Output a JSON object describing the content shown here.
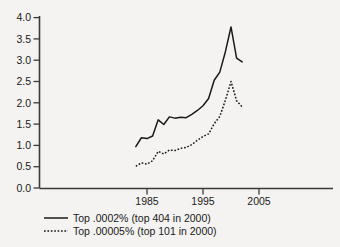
{
  "chart_data": {
    "type": "line",
    "title": "",
    "subtitle": "",
    "xlabel": "",
    "ylabel": "",
    "xlim": [
      1982,
      2006.5
    ],
    "ylim": [
      0.0,
      4.0
    ],
    "grid": false,
    "legend_position": "bottom-left",
    "yticks": [
      "0.0",
      "0.5",
      "1.0",
      "1.5",
      "2.0",
      "2.5",
      "3.0",
      "3.5",
      "4.0"
    ],
    "ytick_values": [
      0.0,
      0.5,
      1.0,
      1.5,
      2.0,
      2.5,
      3.0,
      3.5,
      4.0
    ],
    "xticks": [
      "1985",
      "1995",
      "2005"
    ],
    "xtick_values": [
      1985,
      1995,
      2005
    ],
    "series": [
      {
        "name": "Top .0002% (top 404 in 2000)",
        "style": "solid",
        "x": [
          1983,
          1984,
          1985,
          1986,
          1987,
          1988,
          1989,
          1990,
          1991,
          1992,
          1993,
          1994,
          1995,
          1996,
          1997,
          1998,
          1999,
          2000,
          2001,
          2002
        ],
        "values": [
          0.97,
          1.18,
          1.16,
          1.22,
          1.6,
          1.49,
          1.67,
          1.64,
          1.66,
          1.65,
          1.73,
          1.82,
          1.93,
          2.1,
          2.53,
          2.72,
          3.2,
          3.78,
          3.05,
          2.96
        ]
      },
      {
        "name": "Top .00005% (top 101 in 2000)",
        "style": "dotted",
        "x": [
          1983,
          1984,
          1985,
          1986,
          1987,
          1988,
          1989,
          1990,
          1991,
          1992,
          1993,
          1994,
          1995,
          1996,
          1997,
          1998,
          1999,
          2000,
          2001,
          2002
        ],
        "values": [
          0.51,
          0.59,
          0.56,
          0.64,
          0.86,
          0.8,
          0.89,
          0.88,
          0.93,
          0.95,
          1.02,
          1.12,
          1.21,
          1.27,
          1.51,
          1.68,
          2.06,
          2.5,
          2.05,
          1.9
        ]
      }
    ]
  },
  "legend": {
    "entries": [
      {
        "label": "Top .0002% (top 404 in 2000)",
        "style": "solid"
      },
      {
        "label": "Top .00005% (top 101 in 2000)",
        "style": "dotted"
      }
    ]
  }
}
